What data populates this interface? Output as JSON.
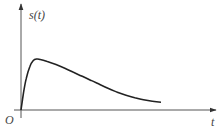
{
  "chart_data": {
    "type": "line",
    "title": "",
    "xlabel": "t",
    "ylabel": "s(t)",
    "origin_label": "O",
    "xlim": [
      0,
      10
    ],
    "ylim": [
      0,
      1.1
    ],
    "grid": false,
    "legend": "none",
    "series": [
      {
        "name": "s(t)",
        "x": [
          0,
          0.15,
          0.3,
          0.5,
          0.7,
          0.9,
          1.1,
          1.5,
          2.0,
          2.5,
          3.0,
          3.5,
          4.0,
          4.5,
          5.0,
          5.5,
          6.0,
          6.5,
          7.0,
          7.5,
          8.0
        ],
        "y": [
          0,
          0.35,
          0.62,
          0.85,
          0.97,
          1.0,
          0.99,
          0.95,
          0.89,
          0.82,
          0.74,
          0.66,
          0.58,
          0.5,
          0.42,
          0.35,
          0.29,
          0.24,
          0.2,
          0.17,
          0.15
        ]
      }
    ]
  }
}
